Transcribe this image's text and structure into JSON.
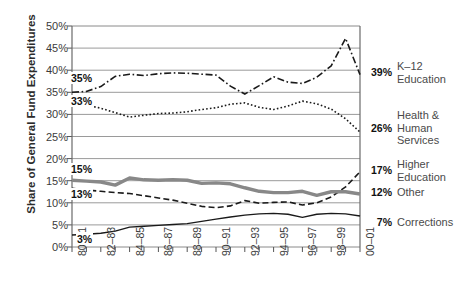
{
  "chart_data": {
    "type": "line",
    "title": "",
    "xlabel": "",
    "ylabel": "Share of General Fund Expenditures",
    "ylim": [
      0,
      50
    ],
    "yticks": [
      "0%",
      "5%",
      "10%",
      "15%",
      "20%",
      "25%",
      "30%",
      "35%",
      "40%",
      "45%",
      "50%"
    ],
    "ytick_values": [
      0,
      5,
      10,
      15,
      20,
      25,
      30,
      35,
      40,
      45,
      50
    ],
    "grid": true,
    "legend_position": "right-inline",
    "categories": [
      "80-81",
      "81-82",
      "82-83",
      "83-84",
      "84-85",
      "85-86",
      "86-87",
      "87-88",
      "88-89",
      "89-90",
      "90-91",
      "91-92",
      "92-93",
      "93-94",
      "94-95",
      "95-96",
      "96-97",
      "97-98",
      "98-99",
      "99-00",
      "00-01"
    ],
    "xtick_labels": [
      "80–81",
      "82–83",
      "84–85",
      "86–87",
      "88–89",
      "90–91",
      "92–93",
      "94–95",
      "96–97",
      "98–99",
      "00–01"
    ],
    "xtick_indices": [
      0,
      2,
      4,
      6,
      8,
      10,
      12,
      14,
      16,
      18,
      20
    ],
    "series": [
      {
        "name": "K-12 Education",
        "label": "K–12\nEducation",
        "start_label": "35%",
        "end_label": "39%",
        "style": "dash-dot",
        "color": "#1a1a1a",
        "width": 1.6,
        "values": [
          35.0,
          35.2,
          36.3,
          38.6,
          39.1,
          38.8,
          39.2,
          39.4,
          39.3,
          39.1,
          38.9,
          36.4,
          34.6,
          36.5,
          38.5,
          37.3,
          37.0,
          38.4,
          41.0,
          47.2,
          39.0
        ],
        "values_plot": [
          35.0,
          35.2,
          36.3,
          38.6,
          39.1,
          38.8,
          39.2,
          39.4,
          39.3,
          39.1,
          38.9,
          36.4,
          34.6,
          36.5,
          38.5,
          37.3,
          37.0,
          38.4,
          41.0,
          47.2,
          39.0
        ]
      },
      {
        "name": "Health & Human Services",
        "label": "Health &\nHuman\nServices",
        "start_label": "33%",
        "end_label": "26%",
        "style": "dotted",
        "color": "#1a1a1a",
        "width": 1.6,
        "values": [
          33.0,
          32.1,
          31.4,
          30.4,
          29.4,
          29.8,
          30.2,
          30.3,
          30.6,
          31.1,
          31.5,
          32.3,
          32.6,
          31.6,
          31.1,
          31.9,
          33.0,
          32.4,
          31.2,
          29.0,
          26.0
        ]
      },
      {
        "name": "Higher Education",
        "label": "Higher\nEducation",
        "start_label": "13%",
        "end_label": "17%",
        "style": "dashed",
        "color": "#1a1a1a",
        "width": 1.6,
        "values": [
          13.3,
          12.9,
          12.6,
          12.3,
          12.1,
          11.6,
          11.1,
          10.6,
          9.9,
          9.2,
          8.9,
          9.3,
          10.5,
          9.9,
          10.1,
          10.2,
          9.5,
          10.0,
          11.3,
          13.6,
          17.0
        ]
      },
      {
        "name": "Other",
        "label": "Other",
        "start_label": "15%",
        "end_label": "12%",
        "style": "solid-thick",
        "color": "#888888",
        "width": 3.4,
        "values": [
          15.1,
          14.9,
          14.7,
          14.0,
          15.6,
          15.2,
          15.1,
          15.2,
          15.1,
          14.4,
          14.5,
          14.3,
          13.4,
          12.6,
          12.3,
          12.3,
          12.6,
          11.7,
          12.5,
          12.5,
          12.0
        ]
      },
      {
        "name": "Corrections",
        "label": "Corrections",
        "start_label": "3%",
        "end_label": "7%",
        "style": "solid-thin",
        "color": "#1a1a1a",
        "width": 1.4,
        "values": [
          2.7,
          2.9,
          3.1,
          3.6,
          4.5,
          4.7,
          4.9,
          5.1,
          5.3,
          5.8,
          6.3,
          6.8,
          7.2,
          7.5,
          7.6,
          7.4,
          6.7,
          7.4,
          7.6,
          7.5,
          7.0
        ]
      }
    ]
  }
}
